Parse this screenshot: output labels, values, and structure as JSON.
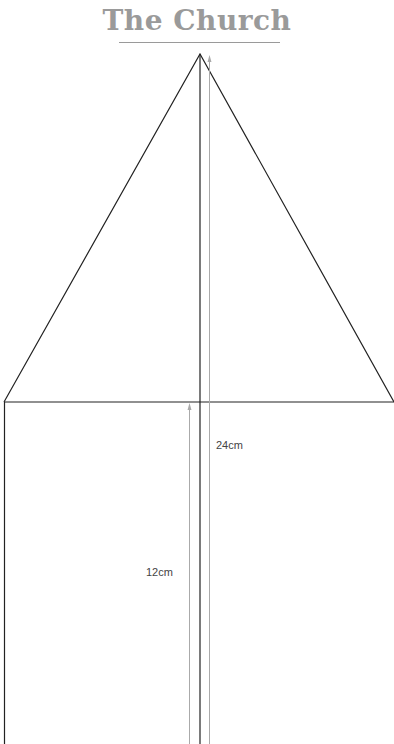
{
  "title": "The Church",
  "labels": {
    "total_height": "24cm",
    "wall_height": "12cm"
  },
  "colors": {
    "title": "#9a9a9a",
    "outline": "#222222",
    "dimension": "#aaaaaa"
  }
}
